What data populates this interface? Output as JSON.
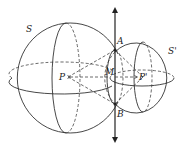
{
  "diagram": {
    "type": "geometry",
    "labels": {
      "sphere_1": "S",
      "sphere_2": "S'",
      "point_a": "A",
      "point_b": "B",
      "point_m": "M",
      "center_1": "P",
      "center_2": "P'"
    },
    "colors": {
      "line": "#333333",
      "background": "#ffffff"
    }
  }
}
